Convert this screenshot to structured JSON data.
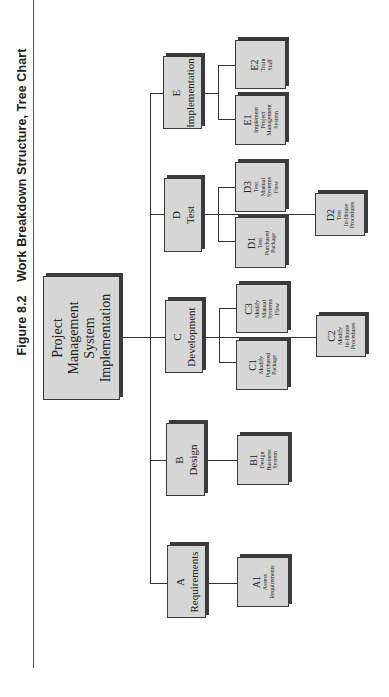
{
  "figure": {
    "number": "Figure 8.2",
    "title": "Work Breakdown Structure, Tree Chart"
  },
  "root": {
    "label": "Project Management System Implementation",
    "lines": [
      "Project",
      "Management",
      "System",
      "Implementation"
    ]
  },
  "branches": [
    {
      "code": "A",
      "label": "Requirements",
      "children": [
        {
          "code": "A1",
          "lines": [
            "Assess",
            "Requirements"
          ]
        }
      ]
    },
    {
      "code": "B",
      "label": "Design",
      "children": [
        {
          "code": "B1",
          "lines": [
            "Design",
            "Business",
            "System"
          ]
        }
      ]
    },
    {
      "code": "C",
      "label": "Development",
      "children": [
        {
          "code": "C1",
          "lines": [
            "Modify",
            "Purchased",
            "Package"
          ]
        },
        {
          "code": "C2",
          "lines": [
            "Modify",
            "In-House",
            "Procedures"
          ]
        },
        {
          "code": "C3",
          "lines": [
            "Modify",
            "Manual",
            "Systems",
            "Flow"
          ]
        }
      ]
    },
    {
      "code": "D",
      "label": "Test",
      "children": [
        {
          "code": "D1",
          "lines": [
            "Test",
            "Purchased",
            "Package"
          ]
        },
        {
          "code": "D2",
          "lines": [
            "Test",
            "In-House",
            "Procedures"
          ]
        },
        {
          "code": "D3",
          "lines": [
            "Test",
            "Manual",
            "Systems",
            "Flow"
          ]
        }
      ]
    },
    {
      "code": "E",
      "label": "Implementation",
      "children": [
        {
          "code": "E1",
          "lines": [
            "Implement",
            "Project",
            "Management",
            "System"
          ]
        },
        {
          "code": "E2",
          "lines": [
            "Train",
            "Staff"
          ]
        }
      ]
    }
  ],
  "colors": {
    "box_fill": "#d6d6d6",
    "box_border": "#3a3a3a",
    "connector": "#333333"
  }
}
